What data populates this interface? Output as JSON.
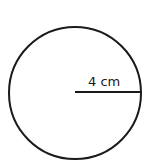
{
  "diagram": {
    "shape": "circle",
    "radius_label": "4 cm",
    "stroke_color": "#1a1a1a",
    "background": "#ffffff"
  }
}
